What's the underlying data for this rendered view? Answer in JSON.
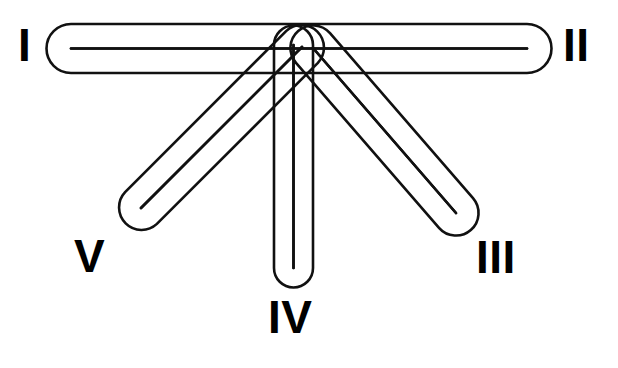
{
  "figure": {
    "background_color": "#ffffff",
    "stroke_color": "#111111",
    "fill_color": "#ffffff",
    "stroke_width": 2.6,
    "canvas": {
      "width": 618,
      "height": 368
    }
  },
  "labels": [
    {
      "id": "I",
      "text": "I",
      "x": 18,
      "y": 22
    },
    {
      "id": "II",
      "text": "II",
      "x": 563,
      "y": 22
    },
    {
      "id": "III",
      "text": "III",
      "x": 476,
      "y": 234
    },
    {
      "id": "IV",
      "text": "IV",
      "x": 268,
      "y": 294
    },
    {
      "id": "V",
      "text": "V",
      "x": 74,
      "y": 233
    }
  ],
  "rays": [
    {
      "id": "ray-I-II",
      "label": "I",
      "second_label": "II",
      "orientation": "horizontal",
      "x1": 71,
      "y1": 48.5,
      "x2": 527,
      "y2": 48.5,
      "thickness": 49
    },
    {
      "id": "ray-V",
      "label": "V",
      "orientation": "diagonal-left",
      "x1": 302,
      "y1": 47,
      "x2": 141,
      "y2": 208,
      "thickness": 45
    },
    {
      "id": "ray-IV",
      "label": "IV",
      "orientation": "vertical",
      "x1": 293.5,
      "y1": 45,
      "x2": 293.5,
      "y2": 268,
      "thickness": 39
    },
    {
      "id": "ray-III",
      "label": "III",
      "orientation": "diagonal-right",
      "x1": 313,
      "y1": 48,
      "x2": 456,
      "y2": 213,
      "thickness": 45
    }
  ]
}
